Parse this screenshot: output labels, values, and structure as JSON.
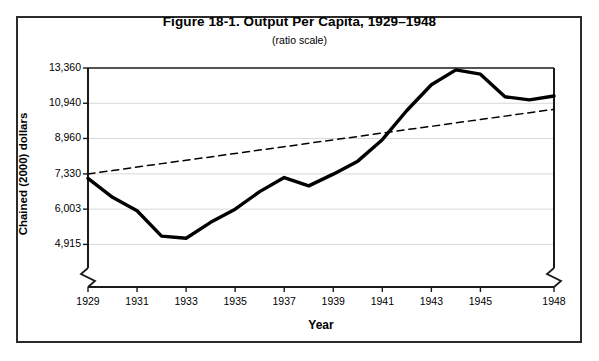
{
  "figure": {
    "title": "Figure 18-1. Output Per Capita, 1929–1948",
    "subtitle": "(ratio scale)",
    "y_axis_title": "Chained (2000) dollars",
    "x_axis_title": "Year"
  },
  "colors": {
    "border": "#2b2b2b",
    "axis": "#1a1a1a",
    "gridline": "#d8d8d8",
    "data_line": "#000000",
    "trend_line": "#000000",
    "background": "#ffffff"
  },
  "chart_data": {
    "type": "line",
    "title": "Figure 18-1. Output Per Capita, 1929–1948",
    "subtitle": "(ratio scale)",
    "xlabel": "Year",
    "ylabel": "Chained (2000) dollars",
    "yscale": "log",
    "ylim": [
      4300,
      13360
    ],
    "xlim": [
      1929,
      1948
    ],
    "grid": true,
    "legend": "none",
    "axis_break_left": true,
    "axis_break_right": true,
    "ytick_labels": [
      "13,360",
      "10,940",
      "8,960",
      "7,330",
      "6,003",
      "4,915"
    ],
    "ytick_values": [
      13360,
      10940,
      8960,
      7330,
      6003,
      4915
    ],
    "xtick_labels": [
      "1929",
      "1931",
      "1933",
      "1935",
      "1937",
      "1939",
      "1941",
      "1943",
      "1945",
      "1948"
    ],
    "xtick_values": [
      1929,
      1931,
      1933,
      1935,
      1937,
      1939,
      1941,
      1943,
      1945,
      1948
    ],
    "x": [
      1929,
      1930,
      1931,
      1932,
      1933,
      1934,
      1935,
      1936,
      1937,
      1938,
      1939,
      1940,
      1941,
      1942,
      1943,
      1944,
      1945,
      1946,
      1947,
      1948
    ],
    "series": [
      {
        "name": "Output per capita",
        "style": "solid",
        "values": [
          7150,
          6420,
          5950,
          5150,
          5090,
          5570,
          6000,
          6630,
          7180,
          6850,
          7320,
          7880,
          8900,
          10500,
          12150,
          13220,
          12900,
          11350,
          11150,
          11400
        ]
      },
      {
        "name": "Trend",
        "style": "dashed",
        "values": [
          7330,
          7470,
          7620,
          7770,
          7920,
          8070,
          8230,
          8390,
          8550,
          8720,
          8890,
          9060,
          9240,
          9420,
          9600,
          9790,
          9980,
          10170,
          10370,
          10570
        ]
      }
    ]
  }
}
